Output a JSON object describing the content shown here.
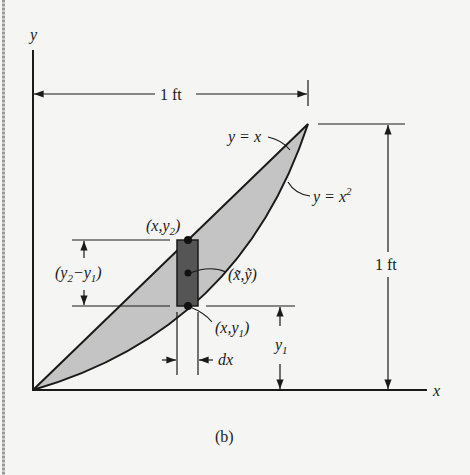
{
  "figure": {
    "caption": "(b)",
    "axes": {
      "x_label": "x",
      "y_label": "y"
    },
    "dimensions": {
      "width_label": "1 ft",
      "height_label": "1 ft"
    },
    "curves": {
      "upper": "y = x",
      "lower_prefix": "y = x",
      "lower_exp": "2"
    },
    "strip": {
      "top_point": "(x,y",
      "top_sub": "2",
      "centroid": "(x̃,ỹ)",
      "bottom_point": "(x,y",
      "bottom_sub": "1",
      "height_label_a": "(y",
      "height_label_sub2": "2",
      "height_label_mid": "−y",
      "height_label_sub1": "1",
      "width_label": "dx",
      "y1_label": "y",
      "y1_sub": "1"
    },
    "colors": {
      "region": "#c4c4c4",
      "strip": "#555555",
      "ink": "#1a1a1a"
    }
  }
}
